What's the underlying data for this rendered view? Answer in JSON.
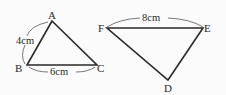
{
  "figure": {
    "triangle_left": {
      "vertices": {
        "A": {
          "label": "A",
          "x": 52,
          "y": 21
        },
        "B": {
          "label": "B",
          "x": 27,
          "y": 65
        },
        "C": {
          "label": "C",
          "x": 97,
          "y": 65
        }
      },
      "measurements": {
        "AB": "4cm",
        "BC": "6cm"
      }
    },
    "triangle_right": {
      "vertices": {
        "F": {
          "label": "F",
          "x": 107,
          "y": 28
        },
        "E": {
          "label": "E",
          "x": 203,
          "y": 28
        },
        "D": {
          "label": "D",
          "x": 168,
          "y": 80
        }
      },
      "measurements": {
        "FE": "8cm"
      }
    },
    "colors": {
      "line": "#2a2a2a",
      "background": "#fbfbfb"
    }
  }
}
